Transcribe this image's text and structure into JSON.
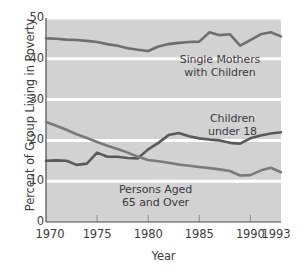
{
  "chart_data": {
    "type": "line",
    "title": "",
    "xlabel": "Year",
    "ylabel": "Percent of Group Living in Poverty",
    "xlim": [
      1970,
      1993
    ],
    "ylim": [
      0,
      50
    ],
    "grid": true,
    "legend_position": "inline-annotations",
    "xticks": [
      "1970",
      "1975",
      "1980",
      "1985",
      "1990",
      "1993"
    ],
    "xtick_values": [
      1970,
      1975,
      1980,
      1985,
      1990,
      1993
    ],
    "yticks": [
      "0",
      "10",
      "20",
      "30",
      "40",
      "50"
    ],
    "ytick_values": [
      0,
      10,
      20,
      30,
      40,
      50
    ],
    "x": [
      1970,
      1971,
      1972,
      1973,
      1974,
      1975,
      1976,
      1977,
      1978,
      1979,
      1980,
      1981,
      1982,
      1983,
      1984,
      1985,
      1986,
      1987,
      1988,
      1989,
      1990,
      1991,
      1992,
      1993
    ],
    "series": [
      {
        "name": "Single Mothers with Children",
        "color": "#6e6e6e",
        "values": [
          45.0,
          44.9,
          44.7,
          44.6,
          44.4,
          44.1,
          43.6,
          43.2,
          42.6,
          42.2,
          41.9,
          43.0,
          43.6,
          43.9,
          44.1,
          44.2,
          46.5,
          45.8,
          46.0,
          43.2,
          44.6,
          46.0,
          46.5,
          45.5
        ]
      },
      {
        "name": "Children under 18",
        "color": "#595959",
        "values": [
          15.0,
          15.1,
          15.0,
          14.0,
          14.3,
          17.0,
          16.0,
          16.0,
          15.7,
          15.6,
          17.8,
          19.4,
          21.3,
          21.8,
          21.0,
          20.5,
          20.2,
          20.0,
          19.4,
          19.2,
          20.5,
          21.2,
          21.7,
          22.0
        ]
      },
      {
        "name": "Persons Aged 65 and Over",
        "color": "#7a7a7a",
        "values": [
          24.5,
          23.6,
          22.6,
          21.5,
          20.6,
          19.6,
          18.7,
          17.9,
          17.0,
          16.0,
          15.2,
          14.9,
          14.5,
          14.1,
          13.8,
          13.5,
          13.2,
          12.9,
          12.5,
          11.4,
          11.5,
          12.6,
          13.3,
          12.2
        ]
      }
    ],
    "annotations": [
      {
        "id": "single-mothers",
        "lines": [
          "Single Mothers",
          "with Children"
        ],
        "line1": "Single Mothers",
        "line2": "with Children"
      },
      {
        "id": "children",
        "lines": [
          "Children",
          "under 18"
        ],
        "line1": "Children",
        "line2": "under 18"
      },
      {
        "id": "elderly",
        "lines": [
          "Persons Aged",
          "65 and Over"
        ],
        "line1": "Persons Aged",
        "line2": "65 and Over"
      }
    ],
    "colors": {
      "plot_background": "#d2d2d2",
      "gridline": "#ffffff",
      "axis": "#4a4a4a",
      "text": "#3c3c3c"
    }
  }
}
